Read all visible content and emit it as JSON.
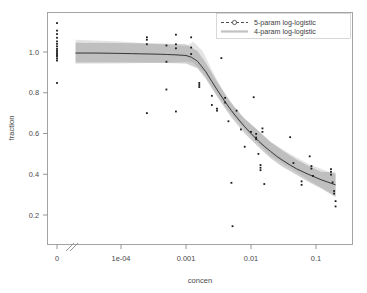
{
  "chart_data": {
    "type": "line",
    "title": "",
    "xlabel": "concen",
    "ylabel": "fraction",
    "xscale": "log-with-zero-break",
    "xticks": [
      "0",
      "1e-04",
      "0.001",
      "0.01",
      "0.1"
    ],
    "xtick_values": [
      0,
      0.0001,
      0.001,
      0.01,
      0.1
    ],
    "yticks": [
      "0.2",
      "0.4",
      "0.6",
      "0.8",
      "1.0"
    ],
    "ytick_values": [
      0.2,
      0.4,
      0.6,
      0.8,
      1.0
    ],
    "xlim": [
      0,
      0.2
    ],
    "ylim": [
      0.12,
      1.16
    ],
    "grid": false,
    "legend_position": "top-right",
    "legend": [
      {
        "label": "5-param log-logistic",
        "marker": "open-circle",
        "linestyle": "dashed",
        "color": "#3a3a3a"
      },
      {
        "label": "4-param log-logistic",
        "marker": "none",
        "linestyle": "solid",
        "color": "#b8b8b8"
      }
    ],
    "series": [
      {
        "name": "5-param log-logistic",
        "kind": "fit-curve",
        "x": [
          2e-05,
          4e-05,
          7e-05,
          0.0001,
          0.00015,
          0.0002,
          0.0003,
          0.0004,
          0.0005,
          0.0007,
          0.0009,
          0.001,
          0.0012,
          0.0015,
          0.002,
          0.0025,
          0.003,
          0.004,
          0.005,
          0.006,
          0.008,
          0.01,
          0.013,
          0.016,
          0.02,
          0.025,
          0.03,
          0.04,
          0.05,
          0.07,
          0.09,
          0.12,
          0.15,
          0.2
        ],
        "y": [
          0.995,
          0.995,
          0.994,
          0.993,
          0.992,
          0.991,
          0.99,
          0.989,
          0.988,
          0.986,
          0.984,
          0.983,
          0.975,
          0.955,
          0.905,
          0.855,
          0.815,
          0.755,
          0.712,
          0.68,
          0.633,
          0.6,
          0.563,
          0.537,
          0.512,
          0.487,
          0.47,
          0.445,
          0.427,
          0.405,
          0.39,
          0.373,
          0.362,
          0.348
        ]
      },
      {
        "name": "4-param log-logistic",
        "kind": "fit-curve",
        "x": [
          2e-05,
          0.0001,
          0.0005,
          0.001,
          0.002,
          0.005,
          0.01,
          0.02,
          0.05,
          0.1,
          0.2
        ],
        "y": [
          0.993,
          0.992,
          0.987,
          0.981,
          0.903,
          0.714,
          0.602,
          0.514,
          0.428,
          0.38,
          0.35
        ]
      },
      {
        "name": "5-param confidence band",
        "kind": "ribbon",
        "x": [
          2e-05,
          0.0001,
          0.0005,
          0.001,
          0.0015,
          0.002,
          0.003,
          0.005,
          0.008,
          0.012,
          0.02,
          0.03,
          0.05,
          0.08,
          0.12,
          0.2
        ],
        "lower": [
          0.948,
          0.948,
          0.946,
          0.944,
          0.92,
          0.87,
          0.782,
          0.678,
          0.6,
          0.545,
          0.478,
          0.438,
          0.398,
          0.36,
          0.33,
          0.288
        ],
        "upper": [
          1.045,
          1.044,
          1.041,
          1.038,
          1.005,
          0.948,
          0.855,
          0.75,
          0.672,
          0.622,
          0.558,
          0.518,
          0.472,
          0.438,
          0.412,
          0.408
        ]
      },
      {
        "name": "4-param confidence band",
        "kind": "ribbon",
        "x": [
          2e-05,
          0.0001,
          0.0005,
          0.001,
          0.0013,
          0.0018,
          0.0025,
          0.004,
          0.007,
          0.012,
          0.02,
          0.04,
          0.08,
          0.2
        ],
        "lower": [
          0.942,
          0.944,
          0.948,
          0.952,
          0.948,
          0.9,
          0.83,
          0.73,
          0.64,
          0.56,
          0.488,
          0.43,
          0.368,
          0.295
        ],
        "upper": [
          1.06,
          1.052,
          1.035,
          1.028,
          1.05,
          1.005,
          0.912,
          0.788,
          0.688,
          0.625,
          0.56,
          0.5,
          0.448,
          0.4
        ]
      },
      {
        "name": "observations",
        "kind": "scatter",
        "points": [
          [
            0,
            1.142
          ],
          [
            0,
            1.105
          ],
          [
            0,
            1.088
          ],
          [
            0,
            1.07
          ],
          [
            0,
            1.052
          ],
          [
            0,
            1.04
          ],
          [
            0,
            1.028
          ],
          [
            0,
            1.016
          ],
          [
            0,
            1.008
          ],
          [
            0,
            1.0
          ],
          [
            0,
            0.992
          ],
          [
            0,
            0.985
          ],
          [
            0,
            0.978
          ],
          [
            0,
            0.968
          ],
          [
            0,
            0.958
          ],
          [
            0,
            0.848
          ],
          [
            0.00025,
            1.072
          ],
          [
            0.00025,
            1.06
          ],
          [
            0.00025,
            1.038
          ],
          [
            0.00025,
            0.7
          ],
          [
            0.0005,
            1.032
          ],
          [
            0.0005,
            0.952
          ],
          [
            0.0005,
            0.816
          ],
          [
            0.0007,
            1.085
          ],
          [
            0.0007,
            1.038
          ],
          [
            0.0007,
            1.018
          ],
          [
            0.0007,
            0.708
          ],
          [
            0.0012,
            1.072
          ],
          [
            0.0012,
            1.022
          ],
          [
            0.0012,
            0.99
          ],
          [
            0.0016,
            0.848
          ],
          [
            0.0016,
            0.838
          ],
          [
            0.0016,
            0.828
          ],
          [
            0.0025,
            0.785
          ],
          [
            0.0025,
            0.74
          ],
          [
            0.003,
            0.722
          ],
          [
            0.003,
            0.712
          ],
          [
            0.0035,
            0.97
          ],
          [
            0.004,
            0.775
          ],
          [
            0.004,
            0.752
          ],
          [
            0.0045,
            0.66
          ],
          [
            0.005,
            0.358
          ],
          [
            0.0052,
            0.145
          ],
          [
            0.006,
            0.712
          ],
          [
            0.007,
            0.62
          ],
          [
            0.008,
            0.535
          ],
          [
            0.01,
            0.608
          ],
          [
            0.011,
            0.778
          ],
          [
            0.012,
            0.598
          ],
          [
            0.012,
            0.58
          ],
          [
            0.012,
            0.572
          ],
          [
            0.013,
            0.5
          ],
          [
            0.014,
            0.445
          ],
          [
            0.014,
            0.432
          ],
          [
            0.014,
            0.42
          ],
          [
            0.015,
            0.625
          ],
          [
            0.015,
            0.608
          ],
          [
            0.016,
            0.352
          ],
          [
            0.04,
            0.582
          ],
          [
            0.045,
            0.455
          ],
          [
            0.06,
            0.365
          ],
          [
            0.06,
            0.348
          ],
          [
            0.08,
            0.488
          ],
          [
            0.085,
            0.44
          ],
          [
            0.085,
            0.428
          ],
          [
            0.09,
            0.392
          ],
          [
            0.17,
            0.425
          ],
          [
            0.17,
            0.412
          ],
          [
            0.17,
            0.398
          ],
          [
            0.18,
            0.36
          ],
          [
            0.19,
            0.318
          ],
          [
            0.19,
            0.305
          ],
          [
            0.2,
            0.268
          ],
          [
            0.2,
            0.242
          ]
        ]
      }
    ]
  },
  "axes": {
    "x_title": "concen",
    "y_title": "fraction",
    "x_tick_labels": [
      "0",
      "1e-04",
      "0.001",
      "0.01",
      "0.1"
    ],
    "y_tick_labels": [
      "0.2",
      "0.4",
      "0.6",
      "0.8",
      "1.0"
    ]
  },
  "legend": {
    "entry_1": "5-param log-logistic",
    "entry_2": "4-param log-logistic"
  }
}
